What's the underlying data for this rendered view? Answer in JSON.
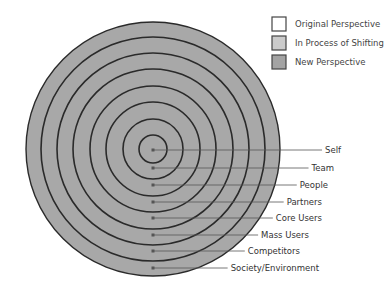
{
  "legend": {
    "items": [
      {
        "label": "Original Perspective",
        "color": "#ffffff"
      },
      {
        "label": "In Process of Shifting",
        "color": "#cbcbcb"
      },
      {
        "label": "New Perspective",
        "color": "#a3a3a3"
      }
    ]
  },
  "diagram": {
    "center": [
      153,
      149
    ],
    "fill_color": "#a8a8a8",
    "ring_color": "#2a2a2a",
    "rings": [
      {
        "label": "Self",
        "radius": 14,
        "dot_y": 150,
        "label_x": 341
      },
      {
        "label": "Team",
        "radius": 30,
        "dot_y": 168,
        "label_x": 334
      },
      {
        "label": "People",
        "radius": 47,
        "dot_y": 185,
        "label_x": 328
      },
      {
        "label": "Partners",
        "radius": 63,
        "dot_y": 202,
        "label_x": 322
      },
      {
        "label": "Core Users",
        "radius": 80,
        "dot_y": 218,
        "label_x": 322
      },
      {
        "label": "Mass Users",
        "radius": 96,
        "dot_y": 235,
        "label_x": 309
      },
      {
        "label": "Competitors",
        "radius": 112,
        "dot_y": 251,
        "label_x": 300
      },
      {
        "label": "Society/Environment",
        "radius": 127,
        "dot_y": 268,
        "label_x": 319
      }
    ]
  }
}
